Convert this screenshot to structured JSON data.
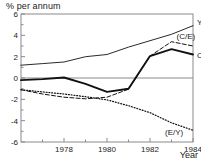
{
  "chart_data": {
    "type": "line",
    "title": "% per annum",
    "xlabel": "Year",
    "ylabel": "% per annum",
    "xlim": [
      1976,
      1984
    ],
    "ylim": [
      -6,
      6
    ],
    "grid": false,
    "legend_position": "right-of-curve-ends",
    "x_ticks": [
      "1978",
      "1980",
      "1982",
      "1984"
    ],
    "x_tick_values": [
      1978,
      1980,
      1982,
      1984
    ],
    "y_ticks": [
      "6",
      "4",
      "2",
      "0",
      "-2",
      "-4",
      "-6"
    ],
    "y_tick_values": [
      6,
      4,
      2,
      0,
      -2,
      -4,
      -6
    ],
    "x": [
      1976,
      1977,
      1978,
      1979,
      1980,
      1981,
      1982,
      1983,
      1984
    ],
    "series": [
      {
        "name": "Y",
        "label": "Y",
        "style": "solid-thin",
        "values": [
          1.2,
          1.35,
          1.5,
          2.0,
          2.2,
          2.9,
          3.5,
          4.1,
          4.9
        ]
      },
      {
        "name": "(C/E)",
        "label": "(C/E)",
        "style": "dashed",
        "values": [
          -1.1,
          -1.5,
          -1.8,
          -1.95,
          -1.8,
          -1.05,
          2.05,
          3.4,
          3.0
        ]
      },
      {
        "name": "C",
        "label": "C",
        "style": "solid-thick",
        "values": [
          -0.2,
          -0.1,
          0.05,
          -0.55,
          -1.3,
          -1.0,
          2.05,
          2.7,
          2.2
        ]
      },
      {
        "name": "(E/Y)",
        "label": "(E/Y)",
        "style": "dotted",
        "values": [
          -1.1,
          -1.3,
          -1.5,
          -1.75,
          -2.05,
          -2.6,
          -3.25,
          -4.2,
          -4.9
        ]
      }
    ]
  }
}
